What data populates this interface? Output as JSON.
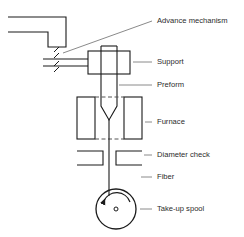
{
  "figure": {
    "background_color": "#ffffff",
    "line_color": "#1a1a1a",
    "leader_color": "#8a8a8a",
    "text_color": "#2b2b2b",
    "dash_color": "#555555"
  },
  "labels": {
    "advance_mechanism": "Advance mechanism",
    "support": "Support",
    "preform": "Preform",
    "furnace": "Furnace",
    "diameter_check": "Diameter check",
    "fiber": "Fiber",
    "take_up_spool": "Take-up spool"
  },
  "parts": [
    {
      "id": "advance-mechanism",
      "label": "Advance mechanism",
      "leader_y": 21,
      "text_x": 157
    },
    {
      "id": "support",
      "label": "Support",
      "leader_y": 62,
      "text_x": 157
    },
    {
      "id": "preform",
      "label": "Preform",
      "leader_y": 85,
      "text_x": 157
    },
    {
      "id": "furnace",
      "label": "Furnace",
      "leader_y": 122,
      "text_x": 157
    },
    {
      "id": "diameter-check",
      "label": "Diameter check",
      "leader_y": 155,
      "text_x": 157
    },
    {
      "id": "fiber",
      "label": "Fiber",
      "leader_y": 177,
      "text_x": 157
    },
    {
      "id": "take-up-spool",
      "label": "Take-up spool",
      "leader_y": 209,
      "text_x": 157
    }
  ],
  "spool": {
    "center_x": 116,
    "center_y": 209,
    "radius": 20,
    "hub_radius": 2,
    "rotation_direction": "counter-clockwise"
  }
}
